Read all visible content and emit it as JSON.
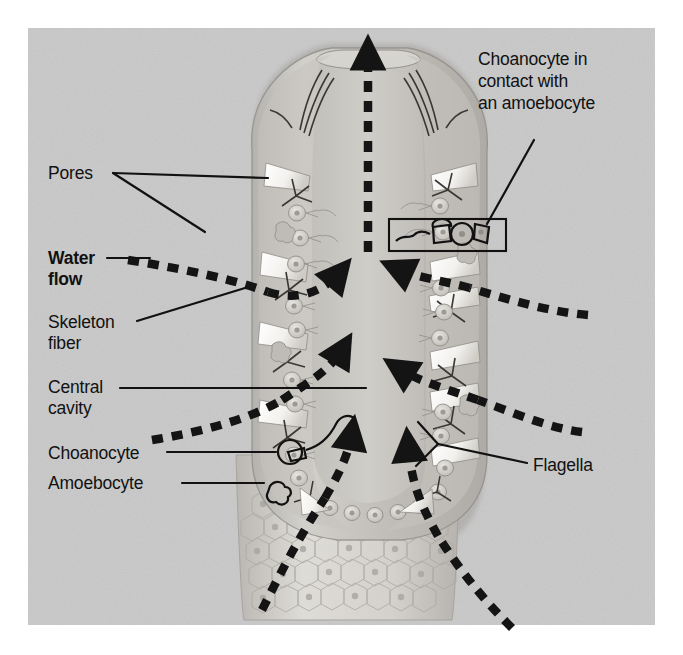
{
  "figure": {
    "background_color": "#c9c9c9",
    "page_color": "#ffffff",
    "line_color": "#111111",
    "panel": {
      "x": 28,
      "y": 28,
      "width": 627,
      "height": 597
    }
  },
  "labels": {
    "pores": "Pores",
    "water_flow_line1": "Water",
    "water_flow_line2": "flow",
    "skeleton_line1": "Skeleton",
    "skeleton_line2": "fiber",
    "central_line1": "Central",
    "central_line2": "cavity",
    "choanocyte": "Choanocyte",
    "amoebocyte": "Amoebocyte",
    "flagella": "Flagella",
    "callout_line1": "Choanocyte in",
    "callout_line2": "contact with",
    "callout_line3": "an amoebocyte"
  },
  "structures": {
    "osculum": "osculum-opening",
    "central_cavity": "spongocoel",
    "body_wall": "sponge-body-wall",
    "epidermis": "hexagonal-epidermal-cells",
    "spicules": "skeleton-fiber-spicules",
    "choanocyte_cells": "collar-cells-with-flagella",
    "amoebocyte_cells": "amoeboid-cells",
    "callout_box": "choanocyte-amoebocyte-detail-box"
  },
  "flow_arrows": {
    "outflow_osculum": "upward-dashed-arrow-through-osculum",
    "inflow_left_upper": "left-dashed-arrow-inward",
    "inflow_left_lower": "left-dashed-arrow-inward-lower",
    "inflow_right_upper": "right-dashed-arrow-inward",
    "inflow_right_lower": "right-dashed-arrow-inward-lower",
    "inflow_bottom_left": "bottom-left-dashed-arrow-upward",
    "inflow_bottom_right": "bottom-right-dashed-arrow-upward",
    "style": "thick-black-dashed"
  }
}
